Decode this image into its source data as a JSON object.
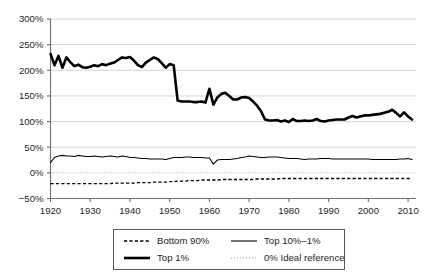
{
  "chart_data": {
    "type": "line",
    "title": "",
    "subtitle": "",
    "xlabel": "",
    "ylabel": "",
    "xlim": [
      1920,
      2012
    ],
    "ylim": [
      -50,
      300
    ],
    "yticks": [
      -50,
      0,
      50,
      100,
      150,
      200,
      250,
      300
    ],
    "ytick_labels": [
      "−50%",
      "0%",
      "50%",
      "100%",
      "150%",
      "200%",
      "250%",
      "300%"
    ],
    "xticks": [
      1920,
      1930,
      1940,
      1950,
      1960,
      1970,
      1980,
      1990,
      2000,
      2010
    ],
    "xtick_labels": [
      "1920",
      "1930",
      "1940",
      "1950",
      "1960",
      "1970",
      "1980",
      "1990",
      "2000",
      "2010"
    ],
    "grid": "horizontal",
    "legend_position": "below-center",
    "colors": {
      "line": "#000000",
      "grid": "#c9c9c9",
      "axis": "#6d6e70",
      "reference": "#8e8e8e",
      "background": "#ffffff"
    },
    "series": [
      {
        "name": "Bottom 90%",
        "style": "dashed",
        "width": 1.35,
        "x": [
          1920,
          1921,
          1922,
          1923,
          1924,
          1925,
          1926,
          1927,
          1928,
          1929,
          1930,
          1931,
          1932,
          1933,
          1934,
          1935,
          1936,
          1937,
          1938,
          1939,
          1940,
          1941,
          1942,
          1943,
          1944,
          1945,
          1946,
          1947,
          1948,
          1949,
          1950,
          1951,
          1952,
          1953,
          1954,
          1955,
          1956,
          1957,
          1958,
          1959,
          1960,
          1961,
          1962,
          1963,
          1964,
          1965,
          1966,
          1967,
          1968,
          1969,
          1970,
          1971,
          1972,
          1973,
          1974,
          1975,
          1976,
          1977,
          1978,
          1979,
          1980,
          1981,
          1982,
          1983,
          1984,
          1985,
          1986,
          1987,
          1988,
          1989,
          1990,
          1991,
          1992,
          1993,
          1994,
          1995,
          1996,
          1997,
          1998,
          1999,
          2000,
          2001,
          2002,
          2003,
          2004,
          2005,
          2006,
          2007,
          2008,
          2009,
          2010,
          2011
        ],
        "values": [
          -21,
          -21,
          -21,
          -21,
          -21,
          -21,
          -21,
          -21,
          -21,
          -21,
          -21,
          -21,
          -21,
          -21,
          -21,
          -21,
          -20,
          -20,
          -20,
          -20,
          -20,
          -20,
          -19,
          -19,
          -19,
          -19,
          -18,
          -18,
          -18,
          -18,
          -17,
          -17,
          -16,
          -16,
          -16,
          -15,
          -15,
          -15,
          -14,
          -14,
          -14,
          -14,
          -14,
          -13,
          -13,
          -13,
          -13,
          -13,
          -13,
          -13,
          -13,
          -13,
          -12,
          -12,
          -12,
          -12,
          -12,
          -12,
          -11,
          -11,
          -11,
          -11,
          -11,
          -11,
          -11,
          -11,
          -11,
          -11,
          -11,
          -11,
          -11,
          -11,
          -11,
          -11,
          -11,
          -11,
          -11,
          -11,
          -11,
          -11,
          -11,
          -11,
          -11,
          -11,
          -11,
          -11,
          -11,
          -11,
          -11,
          -11,
          -11,
          -11
        ]
      },
      {
        "name": "Top 10%–1%",
        "style": "solid-thin",
        "width": 1.1,
        "x": [
          1920,
          1921,
          1922,
          1923,
          1924,
          1925,
          1926,
          1927,
          1928,
          1929,
          1930,
          1931,
          1932,
          1933,
          1934,
          1935,
          1936,
          1937,
          1938,
          1939,
          1940,
          1941,
          1942,
          1943,
          1944,
          1945,
          1946,
          1947,
          1948,
          1949,
          1950,
          1951,
          1952,
          1953,
          1954,
          1955,
          1956,
          1957,
          1958,
          1959,
          1960,
          1961,
          1962,
          1963,
          1964,
          1965,
          1966,
          1967,
          1968,
          1969,
          1970,
          1971,
          1972,
          1973,
          1974,
          1975,
          1976,
          1977,
          1978,
          1979,
          1980,
          1981,
          1982,
          1983,
          1984,
          1985,
          1986,
          1987,
          1988,
          1989,
          1990,
          1991,
          1992,
          1993,
          1994,
          1995,
          1996,
          1997,
          1998,
          1999,
          2000,
          2001,
          2002,
          2003,
          2004,
          2005,
          2006,
          2007,
          2008,
          2009,
          2010,
          2011
        ],
        "values": [
          20,
          30,
          33,
          34,
          33,
          33,
          32,
          34,
          33,
          32,
          32,
          33,
          32,
          31,
          32,
          33,
          32,
          31,
          33,
          32,
          30,
          30,
          29,
          28,
          28,
          27,
          27,
          27,
          27,
          26,
          28,
          30,
          30,
          30,
          31,
          31,
          30,
          30,
          30,
          29,
          29,
          17,
          25,
          26,
          26,
          26,
          27,
          28,
          30,
          31,
          33,
          32,
          31,
          30,
          30,
          31,
          31,
          31,
          30,
          29,
          28,
          28,
          28,
          27,
          26,
          27,
          27,
          27,
          28,
          28,
          28,
          27,
          27,
          27,
          27,
          27,
          27,
          27,
          27,
          27,
          27,
          26,
          26,
          26,
          26,
          26,
          26,
          26,
          27,
          27,
          28,
          26
        ]
      },
      {
        "name": "Top 1%",
        "style": "solid-thick",
        "width": 2.6,
        "x": [
          1920,
          1921,
          1922,
          1923,
          1924,
          1925,
          1926,
          1927,
          1928,
          1929,
          1930,
          1931,
          1932,
          1933,
          1934,
          1935,
          1936,
          1937,
          1938,
          1939,
          1940,
          1941,
          1942,
          1943,
          1944,
          1945,
          1946,
          1947,
          1948,
          1949,
          1950,
          1951,
          1952,
          1953,
          1954,
          1955,
          1956,
          1957,
          1958,
          1959,
          1960,
          1961,
          1962,
          1963,
          1964,
          1965,
          1966,
          1967,
          1968,
          1969,
          1970,
          1971,
          1972,
          1973,
          1974,
          1975,
          1976,
          1977,
          1978,
          1979,
          1980,
          1981,
          1982,
          1983,
          1984,
          1985,
          1986,
          1987,
          1988,
          1989,
          1990,
          1991,
          1992,
          1993,
          1994,
          1995,
          1996,
          1997,
          1998,
          1999,
          2000,
          2001,
          2002,
          2003,
          2004,
          2005,
          2006,
          2007,
          2008,
          2009,
          2010,
          2011
        ],
        "values": [
          232,
          210,
          228,
          205,
          225,
          216,
          208,
          211,
          206,
          205,
          207,
          210,
          208,
          212,
          210,
          213,
          215,
          220,
          225,
          224,
          226,
          219,
          210,
          206,
          215,
          220,
          225,
          222,
          214,
          205,
          212,
          210,
          141,
          139,
          139,
          139,
          138,
          138,
          139,
          137,
          164,
          133,
          147,
          154,
          156,
          150,
          143,
          143,
          147,
          148,
          146,
          139,
          131,
          120,
          104,
          102,
          102,
          103,
          100,
          102,
          99,
          105,
          101,
          101,
          102,
          101,
          102,
          105,
          101,
          100,
          102,
          103,
          104,
          104,
          104,
          108,
          111,
          108,
          110,
          112,
          112,
          113,
          114,
          115,
          117,
          119,
          123,
          117,
          110,
          118,
          110,
          104
        ]
      },
      {
        "name": "0% Ideal reference",
        "style": "dotted",
        "width": 0.9,
        "constant": 0
      }
    ],
    "legend": [
      {
        "label": "Bottom 90%",
        "style": "dashed"
      },
      {
        "label": "Top 10%–1%",
        "style": "solid-thin"
      },
      {
        "label": "Top 1%",
        "style": "solid-thick"
      },
      {
        "label": "0% Ideal reference",
        "style": "dotted"
      }
    ]
  }
}
